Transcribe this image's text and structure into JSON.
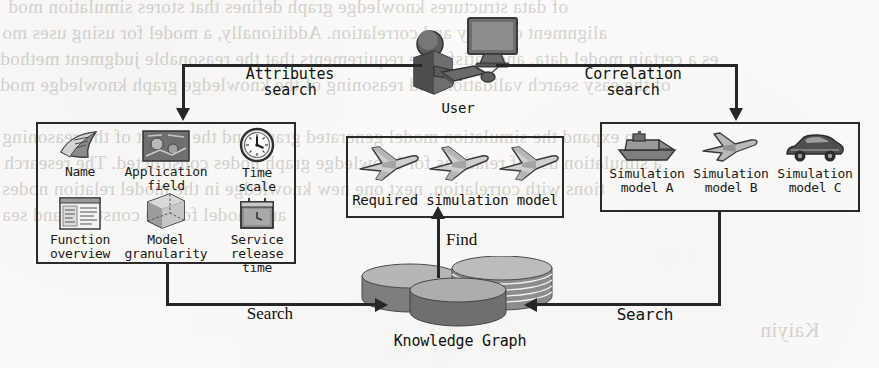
{
  "figure": {
    "background_color": "#fbfaf8",
    "ink_color": "#262626"
  },
  "actor": {
    "label": "User",
    "icon": "user-at-computer-icon"
  },
  "flows": {
    "attributes_search": "Attributes\nsearch",
    "correlation_search": "Correlation\nsearch",
    "search_left": "Search",
    "search_right": "Search",
    "find": "Find"
  },
  "attributes_panel": {
    "name": "attributes-panel",
    "items": [
      {
        "label": "Name",
        "icon": "newspaper-icon"
      },
      {
        "label": "Application\nfield",
        "icon": "application-field-icon"
      },
      {
        "label": "Time\nscale",
        "icon": "clock-icon"
      },
      {
        "label": "Function\noverview",
        "icon": "document-window-icon"
      },
      {
        "label": "Model\ngranularity",
        "icon": "wireframe-cube-icon"
      },
      {
        "label": "Service\nrelease time",
        "icon": "calendar-icon"
      }
    ]
  },
  "result_panel": {
    "name": "required-model-panel",
    "caption": "Required simulation model",
    "icons": [
      "airplane-icon",
      "airplane-icon",
      "airplane-icon"
    ]
  },
  "correlation_panel": {
    "name": "correlation-models-panel",
    "items": [
      {
        "label": "Simulation\nmodel A",
        "icon": "ship-icon"
      },
      {
        "label": "Simulation\nmodel B",
        "icon": "airplane-icon"
      },
      {
        "label": "Simulation\nmodel C",
        "icon": "car-icon"
      }
    ]
  },
  "knowledge_graph": {
    "label": "Knowledge Graph",
    "icon": "database-stack-icon"
  },
  "ghost_text": [
    {
      "text": "of data structures knowledge graph defines that stores simulation mod",
      "x": 8,
      "y": -4,
      "size": 19
    },
    {
      "text": "alignment of many and correlation. Additionally, a model for using uses mo",
      "x": 2,
      "y": 22,
      "size": 19
    },
    {
      "text": "es a certain model data, and satisfy the requirements that the reasonable judgment method",
      "x": 0,
      "y": 48,
      "size": 19
    },
    {
      "text": "of the easy search validation and reasoning of the knowledge graph knowledge mod",
      "x": 0,
      "y": 74,
      "size": 19
    },
    {
      "text": "to expand the simulation model generated graph and the output of the reasoning",
      "x": 2,
      "y": 126,
      "size": 19
    },
    {
      "text": "a simulation use of relations for knowledge graph nodes constructed. The research",
      "x": 4,
      "y": 152,
      "size": 19
    },
    {
      "text": "tions with correlation, next one new knowledge in the model relation nodes",
      "x": 2,
      "y": 178,
      "size": 19
    },
    {
      "text": "and model for the construct and sea",
      "x": 2,
      "y": 204,
      "size": 19
    },
    {
      "text": "Kaiyin",
      "x": 760,
      "y": 318,
      "size": 21
    }
  ]
}
